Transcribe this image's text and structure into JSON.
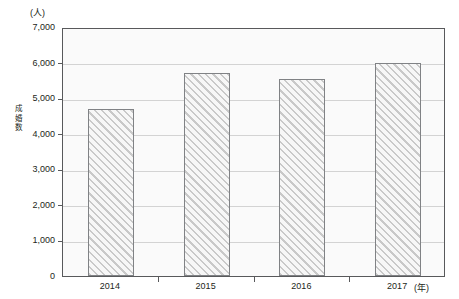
{
  "chart_data": {
    "type": "bar",
    "title": "",
    "subtitle": "",
    "xlabel": "年",
    "ylabel": "成婚数",
    "y_unit_label": "(人)",
    "x_unit_label": "(年)",
    "categories": [
      "2014",
      "2015",
      "2016",
      "2017"
    ],
    "values": [
      4700,
      5700,
      5550,
      6000
    ],
    "series": [
      {
        "name": "成婚数",
        "values": [
          4700,
          5700,
          5550,
          6000
        ]
      }
    ],
    "ylim": [
      0,
      7000
    ],
    "ytick_values": [
      0,
      1000,
      2000,
      3000,
      4000,
      5000,
      6000,
      7000
    ],
    "ytick_labels": [
      "0",
      "1,000",
      "2,000",
      "3,000",
      "4,000",
      "5,000",
      "6,000",
      "7,000"
    ],
    "grid": true,
    "grid_axis": "y",
    "legend": false,
    "legend_position": "none",
    "bar_fill": "diagonal-hatch",
    "colors": {
      "bar_edge": "#808285",
      "bar_hatch": "#c9c9c9",
      "plot_border": "#58595b",
      "plot_background": "#fafafa",
      "gridline": "#d3d3d3",
      "text": "#231f20"
    }
  },
  "axis_title_y_chars": [
    "成",
    "婚",
    "数"
  ]
}
